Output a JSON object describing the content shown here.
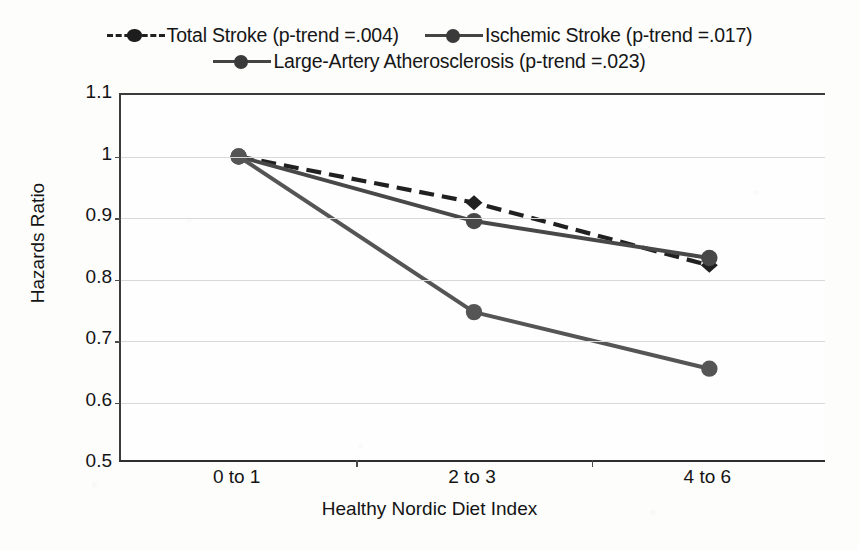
{
  "chart_data": {
    "type": "line",
    "title": "",
    "xlabel": "Healthy Nordic Diet Index",
    "ylabel": "Hazards Ratio",
    "categories": [
      "0 to 1",
      "2 to 3",
      "4 to 6"
    ],
    "ylim": [
      0.5,
      1.1
    ],
    "ytick_labels": [
      "1.1",
      "1",
      "0.9",
      "0.8",
      "0.7",
      "0.6",
      "0.5"
    ],
    "ytick_values": [
      1.1,
      1.0,
      0.9,
      0.8,
      0.7,
      0.6,
      0.5
    ],
    "grid": true,
    "legend_position": "top",
    "series": [
      {
        "name": "Total Stroke (p-trend =.004)",
        "short_name": "Total Stroke",
        "p_trend": ".004",
        "style": "dashed",
        "marker": "diamond",
        "color": "#202020",
        "values": [
          1.0,
          0.925,
          0.823
        ]
      },
      {
        "name": "Ischemic Stroke (p-trend =.017)",
        "short_name": "Ischemic Stroke",
        "p_trend": ".017",
        "style": "solid",
        "marker": "circle",
        "color": "#484848",
        "values": [
          1.0,
          0.895,
          0.835
        ]
      },
      {
        "name": "Large-Artery Atherosclerosis (p-trend =.023)",
        "short_name": "Large-Artery Atherosclerosis",
        "p_trend": ".023",
        "style": "solid",
        "marker": "circle",
        "color": "#555555",
        "values": [
          1.0,
          0.747,
          0.655
        ]
      }
    ]
  },
  "legend": {
    "row1": [
      "Total Stroke (p-trend =.004)",
      "Ischemic Stroke (p-trend =.017)"
    ],
    "row2": [
      "Large-Artery Atherosclerosis (p-trend =.023)"
    ]
  },
  "axes": {
    "y_title": "Hazards Ratio",
    "x_title": "Healthy Nordic Diet Index",
    "y_labels": [
      "1.1",
      "1",
      "0.9",
      "0.8",
      "0.7",
      "0.6",
      "0.5"
    ],
    "x_labels": [
      "0 to 1",
      "2 to 3",
      "4 to 6"
    ]
  }
}
